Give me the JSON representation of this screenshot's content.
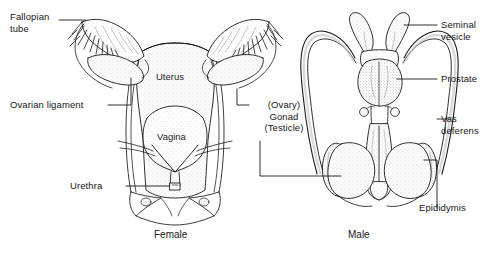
{
  "figure": {
    "background_color": "#ffffff",
    "ink_color": "#1a1a1a",
    "stipple_color": "#8a8a8a"
  },
  "captions": {
    "female": "Female",
    "male": "Male"
  },
  "labels": {
    "fallopian_tube": "Fallopian\ntube",
    "ovarian_ligament": "Ovarian ligament",
    "urethra": "Urethra",
    "gonad": "(Ovary)\nGonad\n(Testicle)",
    "seminal_vesicle": "Seminal\nvesicle",
    "prostate": "Prostate",
    "vas_deferens": "Vas\ndeferens",
    "epididymis": "Epididymis"
  },
  "inner_labels": {
    "uterus": "Uterus",
    "vagina": "Vagina"
  },
  "parts_female": [
    "fallopian tube",
    "fimbriae",
    "ovary",
    "ovarian ligament",
    "uterus",
    "vagina",
    "urethra"
  ],
  "parts_male": [
    "seminal vesicle",
    "prostate",
    "vas deferens",
    "testicle",
    "epididymis",
    "penis"
  ]
}
